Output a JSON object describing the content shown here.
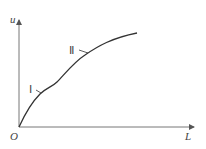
{
  "diagram": {
    "type": "curve-sketch",
    "axes": {
      "y_label": "u",
      "x_label": "L",
      "origin_label": "O"
    },
    "curve": {
      "description": "monotonically increasing S-like curve from origin with two marked regions",
      "points": [
        [
          19,
          127
        ],
        [
          28,
          112
        ],
        [
          40,
          94
        ],
        [
          55,
          84
        ],
        [
          68,
          70
        ],
        [
          85,
          55
        ],
        [
          105,
          42
        ],
        [
          120,
          36
        ],
        [
          137,
          33
        ]
      ]
    },
    "markers": [
      {
        "label": "Ⅰ",
        "at": [
          40,
          94
        ]
      },
      {
        "label": "Ⅱ",
        "at": [
          88,
          53
        ]
      }
    ],
    "colors": {
      "stroke": "#333333",
      "axis": "#777777"
    }
  }
}
